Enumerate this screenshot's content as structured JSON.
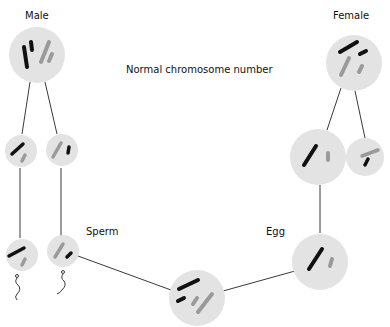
{
  "title": "Normal chromosome number",
  "labels": {
    "male": "Male",
    "female": "Female",
    "sperm": "Sperm",
    "egg": "Egg"
  },
  "colors": {
    "cell": "#e3e3e3",
    "maternal_chromosome": "#111111",
    "paternal_chromosome": "#9a9a9a",
    "line": "#222222",
    "background": "#ffffff"
  },
  "cells": [
    {
      "id": "male-parent",
      "role": "Male diploid cell"
    },
    {
      "id": "male-daughter-1",
      "role": "Male haploid cell"
    },
    {
      "id": "male-daughter-2",
      "role": "Male haploid cell"
    },
    {
      "id": "sperm-1",
      "role": "Sperm"
    },
    {
      "id": "sperm-2",
      "role": "Sperm"
    },
    {
      "id": "female-parent",
      "role": "Female diploid cell"
    },
    {
      "id": "female-daughter-1",
      "role": "Female haploid cell"
    },
    {
      "id": "female-daughter-2",
      "role": "Polar body"
    },
    {
      "id": "egg",
      "role": "Egg"
    },
    {
      "id": "zygote",
      "role": "Zygote"
    }
  ]
}
